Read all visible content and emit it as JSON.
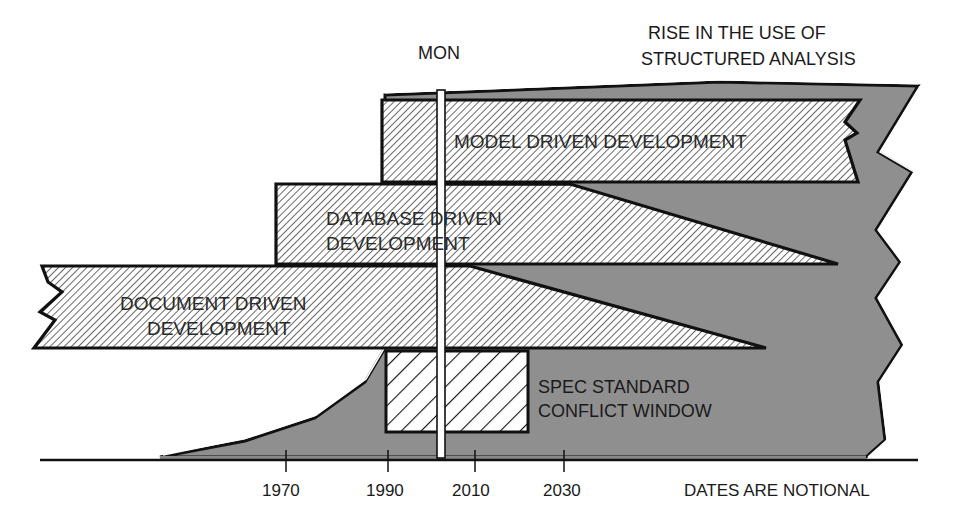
{
  "diagram": {
    "title_top_right": [
      "RISE IN THE USE OF",
      "STRUCTURED ANALYSIS"
    ],
    "marker_label": "MON",
    "bands": [
      {
        "label_lines": [
          "MODEL DRIVEN DEVELOPMENT"
        ]
      },
      {
        "label_lines": [
          "DATABASE DRIVEN",
          "DEVELOPMENT"
        ]
      },
      {
        "label_lines": [
          "DOCUMENT DRIVEN",
          "DEVELOPMENT"
        ]
      }
    ],
    "conflict_window": {
      "label_lines": [
        "SPEC STANDARD",
        "CONFLICT WINDOW"
      ]
    },
    "axis": {
      "ticks": [
        "1970",
        "1990",
        "2010",
        "2030"
      ],
      "note": "DATES ARE NOTIONAL"
    },
    "colors": {
      "area_fill": "#8f8f8f",
      "outline": "#111111",
      "hatch_line": "#3a3a3a",
      "background": "#ffffff"
    }
  }
}
